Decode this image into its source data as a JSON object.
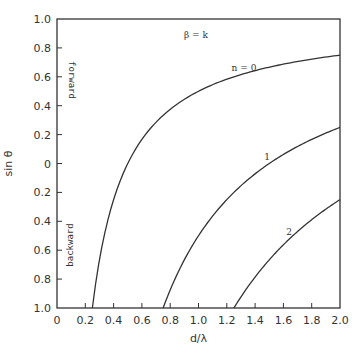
{
  "chart_data": {
    "type": "line",
    "title": "",
    "xlabel": "d/λ",
    "ylabel": "sin θ",
    "xlim": [
      0,
      2.0
    ],
    "ylim": [
      -1.0,
      1.0
    ],
    "grid": false,
    "x_ticks": [
      "0",
      "0.2",
      "0.4",
      "0.6",
      "0.8",
      "1.0",
      "1.2",
      "1.4",
      "1.6",
      "1.8",
      "2.0"
    ],
    "y_ticks": [
      "1.0",
      "0.8",
      "0.6",
      "0.4",
      "0.2",
      "0",
      "0.2",
      "0.4",
      "0.6",
      "0.8",
      "1.0"
    ],
    "y_tick_values": [
      1.0,
      0.8,
      0.6,
      0.4,
      0.2,
      0,
      -0.2,
      -0.4,
      -0.6,
      -0.8,
      -1.0
    ],
    "annotations": {
      "condition": "β = k",
      "forward": "forward",
      "backward": "backward"
    },
    "series": [
      {
        "name": "n = 0",
        "label": "n = 0",
        "x": [
          0.25,
          0.3,
          0.4,
          0.5,
          0.6,
          0.8,
          1.0,
          1.2,
          1.4,
          1.6,
          1.8,
          2.0
        ],
        "y": [
          -1.0,
          -0.667,
          -0.25,
          0.0,
          0.167,
          0.375,
          0.5,
          0.583,
          0.643,
          0.688,
          0.722,
          0.75
        ]
      },
      {
        "name": "n = 1",
        "label": "1",
        "x": [
          0.75,
          0.8,
          0.9,
          1.0,
          1.2,
          1.4,
          1.6,
          1.8,
          2.0
        ],
        "y": [
          -1.0,
          -0.875,
          -0.667,
          -0.5,
          -0.25,
          -0.071,
          0.063,
          0.167,
          0.25
        ]
      },
      {
        "name": "n = 2",
        "label": "2",
        "x": [
          1.25,
          1.3,
          1.4,
          1.5,
          1.6,
          1.7,
          1.8,
          1.9,
          2.0
        ],
        "y": [
          -1.0,
          -0.923,
          -0.786,
          -0.667,
          -0.5625,
          -0.471,
          -0.389,
          -0.316,
          -0.25
        ]
      }
    ]
  }
}
